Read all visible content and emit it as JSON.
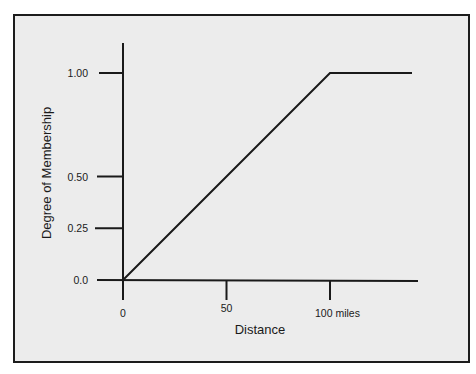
{
  "chart_data": {
    "type": "line",
    "title": "",
    "xlabel": "Distance",
    "ylabel": "Degree of Membership",
    "x_ticks": [
      {
        "value": 0,
        "label": "0"
      },
      {
        "value": 50,
        "label": "50"
      },
      {
        "value": 100,
        "label": "100 miles"
      }
    ],
    "y_ticks": [
      {
        "value": 0.0,
        "label": "0.0"
      },
      {
        "value": 0.25,
        "label": "0.25"
      },
      {
        "value": 0.5,
        "label": "0.50"
      },
      {
        "value": 1.0,
        "label": "1.00"
      }
    ],
    "series": [
      {
        "name": "membership function",
        "x": [
          0,
          100,
          140
        ],
        "y": [
          0.0,
          1.0,
          1.0
        ]
      }
    ],
    "xlim": [
      0,
      140
    ],
    "ylim": [
      0,
      1.0
    ],
    "grid": false,
    "legend": null
  },
  "colors": {
    "background": "#ececec",
    "page": "#ffffff",
    "ink": "#1a1a1a"
  }
}
